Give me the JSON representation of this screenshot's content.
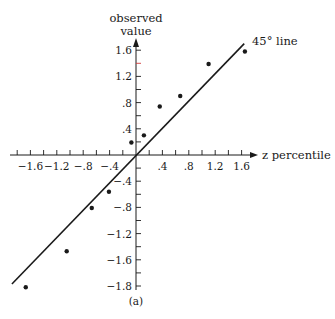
{
  "chart_data": {
    "type": "scatter",
    "title": "",
    "caption": "(a)",
    "xlabel": "z percentile",
    "ylabel_lines": [
      "observed",
      "value"
    ],
    "xlim": [
      -1.8,
      1.8
    ],
    "ylim": [
      -2.0,
      1.8
    ],
    "grid": false,
    "x_ticks": [
      {
        "value": -1.6,
        "label": "−1.6"
      },
      {
        "value": -1.2,
        "label": "−1.2"
      },
      {
        "value": -0.8,
        "label": "−.8"
      },
      {
        "value": -0.4,
        "label": "−.4"
      },
      {
        "value": 0.4,
        "label": ".4"
      },
      {
        "value": 0.8,
        "label": ".8"
      },
      {
        "value": 1.2,
        "label": "1.2"
      },
      {
        "value": 1.6,
        "label": "1.6"
      }
    ],
    "y_ticks": [
      {
        "value": 1.6,
        "label": "1.6"
      },
      {
        "value": 1.2,
        "label": "1.2"
      },
      {
        "value": 0.8,
        "label": ".8"
      },
      {
        "value": 0.4,
        "label": ".4"
      },
      {
        "value": -0.4,
        "label": "−.4"
      },
      {
        "value": -0.8,
        "label": "−.8"
      },
      {
        "value": -1.2,
        "label": "−1.2"
      },
      {
        "value": -1.6,
        "label": "−1.6"
      },
      {
        "value": -2.0,
        "label": "−1.8"
      }
    ],
    "points": [
      {
        "x": -1.67,
        "y": -2.02
      },
      {
        "x": -1.05,
        "y": -1.47
      },
      {
        "x": -0.67,
        "y": -0.81
      },
      {
        "x": -0.41,
        "y": -0.56
      },
      {
        "x": -0.07,
        "y": 0.19
      },
      {
        "x": 0.12,
        "y": 0.3
      },
      {
        "x": 0.36,
        "y": 0.74
      },
      {
        "x": 0.67,
        "y": 0.9
      },
      {
        "x": 1.1,
        "y": 1.39
      },
      {
        "x": 1.65,
        "y": 1.58
      }
    ],
    "reference_line": {
      "label": "45° line",
      "from": [
        -1.88,
        -1.97
      ],
      "to": [
        1.64,
        1.7
      ]
    },
    "colors": {
      "ink": "#1a1a1a",
      "accent_tick": "#d23a3a",
      "background": "#ffffff"
    }
  }
}
